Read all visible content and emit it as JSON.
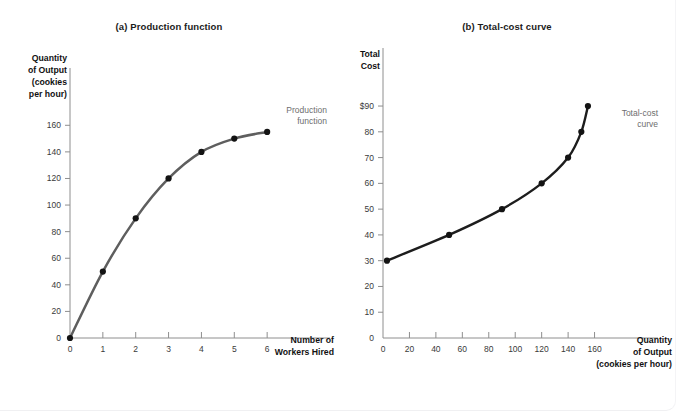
{
  "figure": {
    "background": "#ffffff"
  },
  "chart_data": [
    {
      "type": "line",
      "id": "production-function",
      "title": "(a) Production function",
      "xlabel": "Number of\nWorkers Hired",
      "xlabel_lines": [
        "Number of",
        "Workers Hired"
      ],
      "ylabel_lines": [
        "Quantity",
        "of Output",
        "(cookies",
        "per hour)"
      ],
      "series_label_lines": [
        "Production",
        "function"
      ],
      "xlim": [
        0,
        7
      ],
      "ylim": [
        0,
        170
      ],
      "xticks": [
        0,
        1,
        2,
        3,
        4,
        5,
        6
      ],
      "xtick_labels": [
        "0",
        "1",
        "2",
        "3",
        "4",
        "5",
        "6"
      ],
      "yticks": [
        0,
        20,
        40,
        60,
        80,
        100,
        120,
        140,
        160
      ],
      "ytick_labels": [
        "0",
        "20",
        "40",
        "60",
        "80",
        "100",
        "120",
        "140",
        "160"
      ],
      "grid": false,
      "legend_position": "inline-right",
      "line_color": "#5e5e5e",
      "marker_color": "#131313",
      "x": [
        0,
        1,
        2,
        3,
        4,
        5,
        6
      ],
      "values": [
        0,
        50,
        90,
        120,
        140,
        150,
        155
      ]
    },
    {
      "type": "line",
      "id": "total-cost-curve",
      "title": "(b) Total-cost curve",
      "xlabel_lines": [
        "Quantity",
        "of Output",
        "(cookies per hour)"
      ],
      "ylabel_lines": [
        "Total",
        "Cost"
      ],
      "series_label_lines": [
        "Total-cost",
        "curve"
      ],
      "xlim": [
        0,
        180
      ],
      "ylim": [
        0,
        97
      ],
      "xticks": [
        0,
        20,
        40,
        60,
        80,
        100,
        120,
        140,
        160
      ],
      "xtick_labels": [
        "0",
        "20",
        "40",
        "60",
        "80",
        "100",
        "120",
        "140",
        "160"
      ],
      "yticks": [
        0,
        10,
        20,
        30,
        40,
        50,
        60,
        70,
        80,
        90
      ],
      "ytick_labels": [
        "0",
        "10",
        "20",
        "30",
        "40",
        "50",
        "60",
        "70",
        "80",
        "$90"
      ],
      "grid": false,
      "legend_position": "inline-right",
      "line_color": "#1d1d1d",
      "marker_color": "#131313",
      "x": [
        3,
        50,
        90,
        120,
        140,
        150,
        155
      ],
      "values": [
        30,
        40,
        50,
        60,
        70,
        80,
        90
      ]
    }
  ]
}
